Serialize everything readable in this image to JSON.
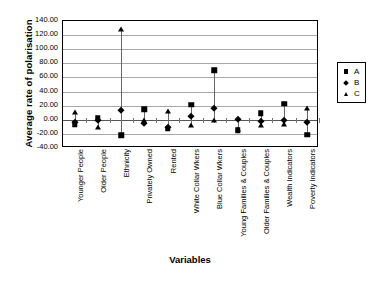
{
  "chart_data": {
    "type": "scatter",
    "title": "",
    "xlabel": "Variables",
    "ylabel": "Average rate of polarisation",
    "ylim": [
      -40,
      140
    ],
    "ytick_step": 20,
    "ytick_labels": [
      "140.00",
      "120.00",
      "100.00",
      "80.00",
      "60.00",
      "40.00",
      "20.00",
      "0.00",
      "-20.00",
      "-40.00"
    ],
    "ytick_values": [
      140,
      120,
      100,
      80,
      60,
      40,
      20,
      0,
      -20,
      -40
    ],
    "grid": true,
    "legend_position": "right",
    "categories": [
      "Younger People",
      "Older People",
      "Ethnicity",
      "Privately Owned",
      "Rented",
      "White Collar Wkers",
      "Blue Collar Wkers",
      "Young Families & Couples",
      "Older Families & Couples",
      "Wealth Indicators",
      "Poverty Indicators"
    ],
    "series": [
      {
        "name": "A",
        "marker": "square",
        "color": "#000000",
        "values": [
          -6,
          2.5,
          -22,
          15,
          -13,
          21,
          70,
          -15,
          9.5,
          23,
          -21
        ]
      },
      {
        "name": "B",
        "marker": "diamond",
        "color": "#000000",
        "values": [
          -3,
          -1,
          14,
          -4.5,
          -10,
          6,
          16.5,
          1,
          -1.5,
          -1,
          -3.5
        ]
      },
      {
        "name": "C",
        "marker": "triangle",
        "color": "#000000",
        "values": [
          11,
          -10,
          128,
          -1,
          12,
          -8,
          -1,
          -13,
          -7.5,
          -6,
          17
        ]
      }
    ]
  },
  "legend": {
    "items": [
      {
        "label": "A",
        "marker": "square"
      },
      {
        "label": "B",
        "marker": "diamond"
      },
      {
        "label": "C",
        "marker": "triangle"
      }
    ]
  }
}
